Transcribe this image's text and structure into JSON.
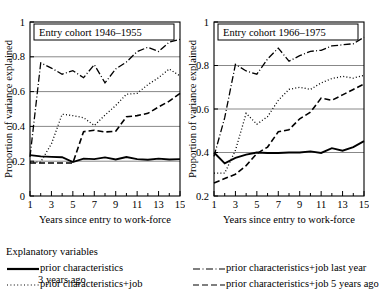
{
  "figure": {
    "ylabel": "Proportion of variance explained",
    "xlabel": "Years since entry to work-force",
    "legend_title": "Explanatory variables"
  },
  "legend": {
    "entries": [
      {
        "key": "prior",
        "label": "prior characteristics",
        "style": "solid",
        "color": "#000000"
      },
      {
        "key": "job_last_year",
        "label": "prior characteristics+job last year",
        "style": "dashdot",
        "color": "#000000"
      },
      {
        "key": "job_3_years",
        "label": "prior characteristics+job",
        "label_cont": "3 years ago",
        "style": "dotted",
        "color": "#000000"
      },
      {
        "key": "job_5_years",
        "label": "prior characteristics+job 5 years ago",
        "style": "dashed",
        "color": "#000000"
      }
    ]
  },
  "chart_data": [
    {
      "type": "line",
      "title": "Entry cohort 1946–1955",
      "xlabel": "Years since entry to work-force",
      "ylabel": "Proportion of variance explained",
      "x": [
        1,
        2,
        3,
        4,
        5,
        6,
        7,
        8,
        9,
        10,
        11,
        12,
        13,
        14,
        15
      ],
      "xlim": [
        1,
        15
      ],
      "ylim": [
        0,
        1
      ],
      "xticks": [
        1,
        3,
        5,
        7,
        9,
        11,
        13,
        15
      ],
      "yticks": [
        0,
        0.2,
        0.4,
        0.6,
        0.8,
        1
      ],
      "ytick_labels": [
        "0",
        "0.2",
        "0.4",
        "0.6",
        "0.8",
        "1"
      ],
      "grid": "horizontal",
      "legend_position": "below-figure",
      "series": [
        {
          "name": "prior characteristics",
          "style": "solid",
          "values": [
            0.235,
            0.228,
            0.225,
            0.223,
            0.195,
            0.215,
            0.212,
            0.222,
            0.21,
            0.224,
            0.212,
            0.208,
            0.215,
            0.21,
            0.212
          ]
        },
        {
          "name": "prior characteristics+job last year",
          "style": "dashdot",
          "values": [
            0.225,
            0.765,
            0.735,
            0.7,
            0.72,
            0.68,
            0.755,
            0.65,
            0.73,
            0.77,
            0.83,
            0.855,
            0.83,
            0.885,
            0.9
          ]
        },
        {
          "name": "prior characteristics+job 3 years ago",
          "style": "dotted",
          "values": [
            0.195,
            0.195,
            0.3,
            0.47,
            0.462,
            0.45,
            0.405,
            0.465,
            0.52,
            0.585,
            0.59,
            0.64,
            0.68,
            0.73,
            0.69
          ]
        },
        {
          "name": "prior characteristics+job 5 years ago",
          "style": "dashed",
          "values": [
            0.19,
            0.19,
            0.19,
            0.19,
            0.19,
            0.37,
            0.378,
            0.368,
            0.372,
            0.455,
            0.462,
            0.475,
            0.512,
            0.545,
            0.59
          ]
        }
      ]
    },
    {
      "type": "line",
      "title": "Entry cohort 1966–1975",
      "xlabel": "Years since entry to work-force",
      "ylabel": "Proportion of variance explained",
      "x": [
        1,
        2,
        3,
        4,
        5,
        6,
        7,
        8,
        9,
        10,
        11,
        12,
        13,
        14,
        15
      ],
      "xlim": [
        1,
        15
      ],
      "ylim": [
        0.2,
        1
      ],
      "xticks": [
        1,
        3,
        5,
        7,
        9,
        11,
        13,
        15
      ],
      "yticks": [
        0.2,
        0.4,
        0.6,
        0.8,
        1
      ],
      "ytick_labels": [
        "0.2",
        "0.4",
        "0.6",
        "0.8",
        "1"
      ],
      "grid": "horizontal",
      "legend_position": "below-figure",
      "series": [
        {
          "name": "prior characteristics",
          "style": "solid",
          "values": [
            0.4,
            0.35,
            0.375,
            0.39,
            0.4,
            0.398,
            0.398,
            0.4,
            0.4,
            0.405,
            0.398,
            0.42,
            0.408,
            0.425,
            0.452
          ]
        },
        {
          "name": "prior characteristics+job last year",
          "style": "dashdot",
          "values": [
            0.382,
            0.56,
            0.805,
            0.775,
            0.76,
            0.83,
            0.88,
            0.82,
            0.845,
            0.865,
            0.87,
            0.89,
            0.895,
            0.9,
            0.93
          ]
        },
        {
          "name": "prior characteristics+job 3 years ago",
          "style": "dotted",
          "values": [
            0.305,
            0.305,
            0.41,
            0.58,
            0.53,
            0.565,
            0.64,
            0.69,
            0.7,
            0.69,
            0.72,
            0.74,
            0.75,
            0.742,
            0.755
          ]
        },
        {
          "name": "prior characteristics+job 5 years ago",
          "style": "dashed",
          "values": [
            0.26,
            0.28,
            0.3,
            0.34,
            0.395,
            0.425,
            0.495,
            0.505,
            0.555,
            0.585,
            0.65,
            0.64,
            0.665,
            0.69,
            0.715
          ]
        }
      ]
    }
  ]
}
